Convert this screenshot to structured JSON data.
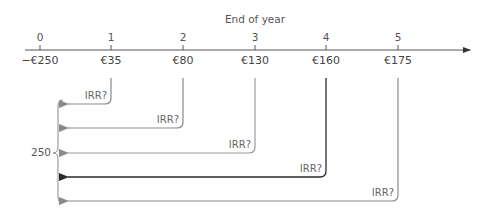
{
  "diagram": {
    "title": "End of year",
    "years": [
      "0",
      "1",
      "2",
      "3",
      "4",
      "5"
    ],
    "cash_flows": [
      "−€250",
      "€35",
      "€80",
      "€130",
      "€160",
      "€175"
    ],
    "irr_labels": [
      "IRR?",
      "IRR?",
      "IRR?",
      "IRR?",
      "IRR?"
    ],
    "brace_label": "250",
    "colors": {
      "timeline": "#555555",
      "arrow_grey": "#8a8a8a",
      "arrow_dark": "#2a2a2a",
      "text": "#555555"
    }
  }
}
